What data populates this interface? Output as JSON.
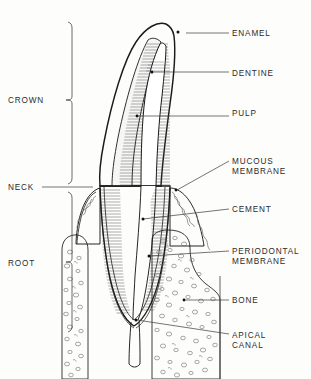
{
  "figure": {
    "type": "anatomical-diagram",
    "background_color": "#fdfdfc",
    "ink_color": "#1a1a1a"
  },
  "labels_right": [
    {
      "key": "enamel",
      "lines": [
        "ENAMEL"
      ],
      "text_x": 232,
      "text_y": 36,
      "leader_from_x": 186,
      "leader_from_y": 33,
      "leader_to_x": 229,
      "leader_to_y": 33,
      "dot_x": 178,
      "dot_y": 32
    },
    {
      "key": "dentine",
      "lines": [
        "DENTINE"
      ],
      "text_x": 232,
      "text_y": 76,
      "leader_from_x": 154,
      "leader_from_y": 72,
      "leader_to_x": 229,
      "leader_to_y": 72,
      "dot_x": 152,
      "dot_y": 72
    },
    {
      "key": "pulp",
      "lines": [
        "PULP"
      ],
      "text_x": 232,
      "text_y": 116,
      "leader_from_x": 138,
      "leader_from_y": 116,
      "leader_to_x": 229,
      "leader_to_y": 116,
      "dot_x": 137,
      "dot_y": 116
    },
    {
      "key": "mucous",
      "lines": [
        "MUCOUS",
        "MEMBRANE"
      ],
      "text_x": 232,
      "text_y": 164,
      "leader_from_x": 177,
      "leader_from_y": 190,
      "leader_to_x": 229,
      "leader_to_y": 161,
      "dot_x": 176,
      "dot_y": 190
    },
    {
      "key": "cement",
      "lines": [
        "CEMENT"
      ],
      "text_x": 232,
      "text_y": 212,
      "leader_from_x": 143,
      "leader_from_y": 219,
      "leader_to_x": 229,
      "leader_to_y": 209,
      "dot_x": 143,
      "dot_y": 219
    },
    {
      "key": "periodontal",
      "lines": [
        "PERIODONTAL",
        "MEMBRANE"
      ],
      "text_x": 232,
      "text_y": 254,
      "leader_from_x": 149,
      "leader_from_y": 256,
      "leader_to_x": 229,
      "leader_to_y": 251,
      "dot_x": 149,
      "dot_y": 256
    },
    {
      "key": "bone",
      "lines": [
        "BONE"
      ],
      "text_x": 232,
      "text_y": 303,
      "leader_from_x": 185,
      "leader_from_y": 300,
      "leader_to_x": 229,
      "leader_to_y": 300,
      "dot_x": 184,
      "dot_y": 300
    },
    {
      "key": "apical",
      "lines": [
        "APICAL",
        "CANAL"
      ],
      "text_x": 232,
      "text_y": 338,
      "leader_from_x": 137,
      "leader_from_y": 320,
      "leader_to_x": 229,
      "leader_to_y": 334,
      "dot_x": 136,
      "dot_y": 320
    }
  ],
  "labels_left": [
    {
      "key": "crown",
      "text": "CROWN",
      "text_x": 8,
      "text_y": 103
    },
    {
      "key": "neck",
      "text": "NECK",
      "text_x": 8,
      "text_y": 187
    },
    {
      "key": "root",
      "text": "ROOT",
      "text_x": 8,
      "text_y": 263
    }
  ],
  "braces": [
    {
      "key": "crown-brace",
      "top_y": 22,
      "bottom_y": 184,
      "mid_y": 100,
      "x": 72,
      "tip_x": 66
    },
    {
      "key": "root-brace",
      "top_y": 192,
      "bottom_y": 332,
      "mid_y": 262,
      "x": 72,
      "tip_x": 66
    }
  ],
  "neck_leader": {
    "from_x": 42,
    "from_y": 187,
    "to_x": 93,
    "to_y": 187
  },
  "regions": [
    {
      "key": "enamel-layer",
      "description": "outer light gray crown shell"
    },
    {
      "key": "dentine-layer",
      "description": "horizontally hatched layer beneath enamel"
    },
    {
      "key": "pulp-cavity",
      "description": "white central chamber tapering into root canal"
    },
    {
      "key": "mucous-membrane",
      "description": "gum tissue with wavy interior texture"
    },
    {
      "key": "cement-layer",
      "description": "thin dark layer coating the root"
    },
    {
      "key": "periodontal-membrane",
      "description": "line between root and bone socket"
    },
    {
      "key": "bone-trabecular",
      "description": "stippled oval cell texture of alveolar bone"
    },
    {
      "key": "apical-canal",
      "description": "narrow channel exiting root apex"
    }
  ]
}
